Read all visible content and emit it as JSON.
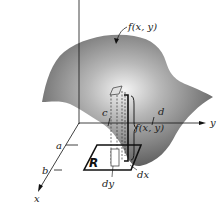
{
  "diagram": {
    "type": "double-integral-volume-element",
    "axes": {
      "x_label": "x",
      "y_label": "y",
      "z_label": ""
    },
    "surface_label": "f(x, y)",
    "height_label": "f(x, y)",
    "region_label": "R",
    "bounds": {
      "x_lower": "a",
      "x_upper": "b",
      "y_lower": "c",
      "y_upper": "d"
    },
    "differentials": {
      "dx": "dx",
      "dy": "dy"
    },
    "colors": {
      "surface_dark": "#5a5a5a",
      "surface_light": "#e8e8e8",
      "lines": "#111111",
      "background": "#ffffff"
    }
  }
}
